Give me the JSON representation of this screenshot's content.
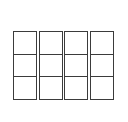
{
  "diagram": {
    "type": "grid",
    "columns": 4,
    "rows": 3,
    "total_cells": 12,
    "colors": {
      "background": "#ffffff",
      "cell_fill": "#ffffff",
      "line": "#3b3b3b"
    },
    "geometry": {
      "left": 13,
      "top": 31,
      "right": 114,
      "bottom": 100,
      "width": 101,
      "height": 69,
      "column_width": 24,
      "column_gap": 2,
      "row_height": 23,
      "line_width": 1
    },
    "column_list": [
      {
        "index": 1,
        "label": "",
        "cells": [
          {
            "label": "",
            "row": 1
          },
          {
            "label": "",
            "row": 2
          },
          {
            "label": "",
            "row": 3
          }
        ]
      },
      {
        "index": 2,
        "label": "",
        "cells": [
          {
            "label": "",
            "row": 1
          },
          {
            "label": "",
            "row": 2
          },
          {
            "label": "",
            "row": 3
          }
        ]
      },
      {
        "index": 3,
        "label": "",
        "cells": [
          {
            "label": "",
            "row": 1
          },
          {
            "label": "",
            "row": 2
          },
          {
            "label": "",
            "row": 3
          }
        ]
      },
      {
        "index": 4,
        "label": "",
        "cells": [
          {
            "label": "",
            "row": 1
          },
          {
            "label": "",
            "row": 2
          },
          {
            "label": "",
            "row": 3
          }
        ]
      }
    ]
  }
}
